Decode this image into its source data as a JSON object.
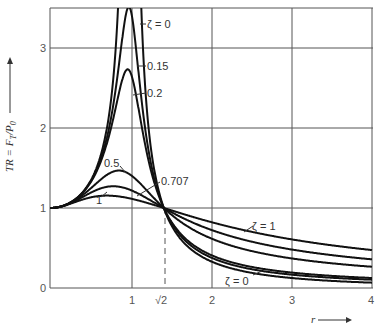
{
  "chart_data": {
    "type": "line",
    "title": "",
    "xlabel": "r",
    "ylabel": "TR = F_T / P_0",
    "xlim": [
      0,
      4
    ],
    "ylim": [
      0,
      3.5
    ],
    "grid": true,
    "x_ticks": [
      "0",
      "1",
      "√2",
      "2",
      "3",
      "4"
    ],
    "x_tick_values": [
      0,
      1,
      1.4142,
      2,
      3,
      4
    ],
    "y_ticks": [
      "0",
      "1",
      "2",
      "3"
    ],
    "y_tick_values": [
      0,
      1,
      2,
      3
    ],
    "formula": "TR = sqrt((1+(2ζr)^2)/((1-r^2)^2+(2ζr)^2))",
    "crossover_point": {
      "x": 1.4142,
      "y": 1,
      "label": "√2"
    },
    "series": [
      {
        "name": "ζ = 0",
        "zeta": 0,
        "peak_at_r1": "infinite"
      },
      {
        "name": "0.15",
        "zeta": 0.15,
        "peak": 3.5
      },
      {
        "name": "0.2",
        "zeta": 0.2,
        "peak": 2.55
      },
      {
        "name": "0.5",
        "zeta": 0.5,
        "peak": 1.45
      },
      {
        "name": "0.707",
        "zeta": 0.707,
        "peak": 1.22
      },
      {
        "name": "ζ = 1",
        "zeta": 1,
        "peak": 1.12
      }
    ],
    "sample_values": {
      "r": [
        0,
        0.5,
        1,
        1.4142,
        2,
        3,
        4
      ],
      "zeta_0": [
        1,
        1.33,
        null,
        1,
        0.33,
        0.125,
        0.067
      ],
      "zeta_0.15": [
        1,
        1.33,
        3.48,
        1,
        0.38,
        0.18,
        0.12
      ],
      "zeta_0.2": [
        1,
        1.34,
        2.69,
        1,
        0.42,
        0.22,
        0.15
      ],
      "zeta_0.5": [
        1,
        1.37,
        1.41,
        1,
        0.57,
        0.39,
        0.29
      ],
      "zeta_0.707": [
        1,
        1.33,
        1.22,
        1,
        0.67,
        0.5,
        0.38
      ],
      "zeta_1": [
        1,
        1.12,
        1.12,
        1,
        0.72,
        0.6,
        0.47
      ]
    },
    "annotations": [
      "ζ = 0",
      "0.15",
      "0.2",
      "0.5",
      "0.707",
      "1",
      "ζ = 1",
      "ζ = 0"
    ]
  },
  "labels": {
    "zeta0_top": "ζ = 0",
    "z015": "0.15",
    "z02": "0.2",
    "z05": "0.5",
    "z0707": "0.707",
    "z1_left": "1",
    "z1_right": "ζ = 1",
    "zeta0_bottom": "ζ = 0",
    "ylabel": "TR = F",
    "ylabel_sub1": "T",
    "ylabel_mid": "/P",
    "ylabel_sub2": "0",
    "xlabel": "r",
    "x0": "0",
    "x1": "1",
    "xs2": "√2",
    "x2": "2",
    "x3": "3",
    "x4": "4",
    "y1": "1",
    "y2": "2",
    "y3": "3"
  }
}
